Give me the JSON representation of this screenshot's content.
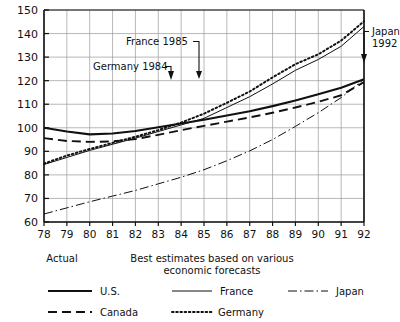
{
  "chart_data": {
    "type": "line",
    "title": "",
    "xlabel": "",
    "ylabel": "",
    "xlim": [
      78,
      92
    ],
    "ylim": [
      60,
      150
    ],
    "grid": true,
    "legend_position": "bottom",
    "x": [
      78,
      79,
      80,
      81,
      82,
      83,
      84,
      85,
      86,
      87,
      88,
      89,
      90,
      91,
      92
    ],
    "xtick_labels": [
      "78",
      "79",
      "80",
      "81",
      "82",
      "83",
      "84",
      "85",
      "86",
      "87",
      "88",
      "89",
      "90",
      "91",
      "92"
    ],
    "ytick_labels": [
      "150",
      "140",
      "130",
      "120",
      "110",
      "100",
      "90",
      "80",
      "70",
      "60"
    ],
    "ytick_values": [
      150,
      140,
      130,
      120,
      110,
      100,
      90,
      80,
      70,
      60
    ],
    "series": [
      {
        "name": "U.S.",
        "style": "solid",
        "values": [
          100.0,
          98.4,
          97.2,
          97.6,
          98.6,
          100.2,
          101.8,
          103.4,
          105.2,
          107.0,
          109.2,
          111.6,
          114.2,
          117.0,
          120.6
        ]
      },
      {
        "name": "Canada",
        "style": "dashed",
        "values": [
          95.6,
          94.4,
          94.0,
          94.2,
          95.2,
          97.0,
          99.0,
          100.8,
          102.6,
          104.4,
          106.4,
          108.6,
          111.0,
          113.8,
          119.4
        ]
      },
      {
        "name": "France",
        "style": "thin-solid",
        "values": [
          84.4,
          87.4,
          90.4,
          93.0,
          95.6,
          98.4,
          101.2,
          104.0,
          108.6,
          113.2,
          118.6,
          124.4,
          129.0,
          134.6,
          143.0
        ]
      },
      {
        "name": "Germany",
        "style": "dotted",
        "values": [
          84.8,
          88.2,
          91.0,
          93.6,
          96.2,
          99.0,
          102.2,
          106.0,
          110.6,
          115.4,
          121.4,
          127.0,
          131.2,
          137.0,
          145.2
        ]
      },
      {
        "name": "Japan",
        "style": "dash-dot",
        "values": [
          63.4,
          66.0,
          68.6,
          71.0,
          73.4,
          76.2,
          79.0,
          82.2,
          86.0,
          90.2,
          95.0,
          100.6,
          106.4,
          112.8,
          120.6
        ]
      }
    ],
    "annotations": [
      {
        "text": "France 1985",
        "target_x": 85,
        "target_y": 110.0
      },
      {
        "text": "Germany 1984",
        "target_x": 84,
        "target_y": 108.5
      },
      {
        "text": "Japan 1992",
        "target_x": 92,
        "target_y": 121.0
      }
    ]
  },
  "captions": {
    "actual": "Actual",
    "forecast_line1": "Best estimates based on various",
    "forecast_line2": "economic forecasts"
  },
  "legend": {
    "items": [
      {
        "label": "U.S.",
        "style": "solid"
      },
      {
        "label": "Canada",
        "style": "dashed"
      },
      {
        "label": "France",
        "style": "thin-solid"
      },
      {
        "label": "Germany",
        "style": "dotted"
      },
      {
        "label": "Japan",
        "style": "dash-dot"
      }
    ]
  }
}
